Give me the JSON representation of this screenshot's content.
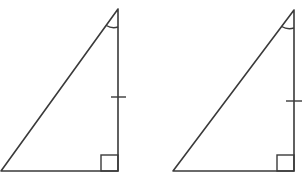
{
  "diagram": {
    "stroke_color": "#3a3a3a",
    "background": "#ffffff",
    "triangles": [
      {
        "id": "triangle-1",
        "vertices": {
          "top": [
            118,
            9
          ],
          "right_angle": [
            118,
            171
          ],
          "bottom_left": [
            1,
            171
          ]
        },
        "tick_mark": {
          "y": 97,
          "x1": 111,
          "x2": 126
        },
        "right_angle_box": {
          "x": 101,
          "y": 155,
          "size": 17
        },
        "angle_arc": {
          "vertex": [
            118,
            9
          ],
          "radius": 18
        }
      },
      {
        "id": "triangle-2",
        "vertices": {
          "top": [
            294,
            10
          ],
          "right_angle": [
            294,
            171
          ],
          "bottom_left": [
            173,
            171
          ]
        },
        "tick_mark": {
          "y": 101,
          "x1": 286,
          "x2": 302
        },
        "right_angle_box": {
          "x": 277,
          "y": 155,
          "size": 17
        },
        "angle_arc": {
          "vertex": [
            294,
            10
          ],
          "radius": 18
        }
      }
    ]
  }
}
